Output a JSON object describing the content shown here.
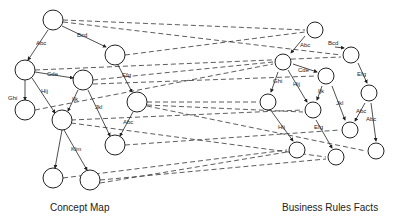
{
  "captions": {
    "left": "Concept Map",
    "right": "Business Rules Facts"
  },
  "left_labels": [
    "Abc",
    "Bcd",
    "Cde",
    "Efg",
    "Ghi",
    "Hij",
    "Ijk",
    "Jkl",
    "Abc",
    "Klm"
  ],
  "right_labels": [
    "Abc",
    "Bcd",
    "Cde",
    "Efg",
    "Ghi",
    "Hij",
    "Ijk",
    "Jkl",
    "Abc",
    "Abc",
    "Hij",
    "Efg"
  ]
}
